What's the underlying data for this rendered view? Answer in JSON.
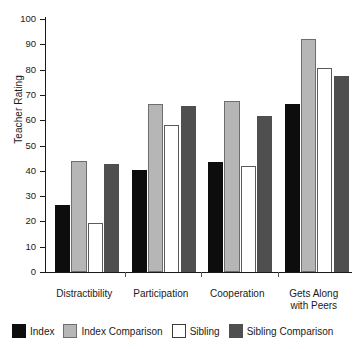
{
  "chart_data": {
    "type": "bar",
    "title": "",
    "subtitle": "",
    "xlabel": "",
    "ylabel": "Teacher Rating",
    "ylim": [
      0,
      100
    ],
    "ytick_step": 10,
    "yticks": [
      0,
      10,
      20,
      30,
      40,
      50,
      60,
      70,
      80,
      90,
      100
    ],
    "ytick_labels": [
      "0",
      "10",
      "20",
      "30",
      "40",
      "50",
      "60",
      "70",
      "80",
      "90",
      "100"
    ],
    "grid": false,
    "legend_position": "bottom",
    "categories": [
      "Distractibility",
      "Participation",
      "Cooperation",
      "Gets Along with Peers"
    ],
    "category_label_lines": [
      [
        "Distractibility"
      ],
      [
        "Participation"
      ],
      [
        "Cooperation"
      ],
      [
        "Gets Along",
        "with Peers"
      ]
    ],
    "series": [
      {
        "name": "Index",
        "color": "#0d0d0d",
        "border": "#0d0d0d",
        "values": [
          26.5,
          40.5,
          43.5,
          66.5
        ]
      },
      {
        "name": "Index Comparison",
        "color": "#b6b6b6",
        "border": "#6e6e6e",
        "values": [
          44.0,
          66.5,
          67.5,
          92.0
        ]
      },
      {
        "name": "Sibling",
        "color": "#ffffff",
        "border": "#5a5a5a",
        "values": [
          19.5,
          58.0,
          42.0,
          80.5
        ]
      },
      {
        "name": "Sibling Comparison",
        "color": "#4f4f4f",
        "border": "#4f4f4f",
        "values": [
          42.5,
          65.5,
          61.5,
          77.5
        ]
      }
    ]
  },
  "legend": {
    "items": [
      {
        "label": "Index",
        "swatch": "black-swatch"
      },
      {
        "label": "Index Comparison",
        "swatch": "light-gray-swatch"
      },
      {
        "label": "Sibling",
        "swatch": "white-swatch"
      },
      {
        "label": "Sibling Comparison",
        "swatch": "dark-gray-swatch"
      }
    ]
  },
  "axis": {
    "y_title": "Teacher Rating"
  }
}
